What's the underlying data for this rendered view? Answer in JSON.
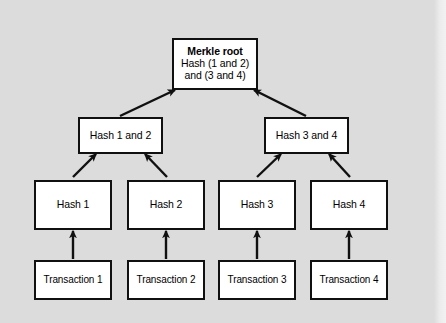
{
  "diagram": {
    "colors": {
      "background": "#dcdcdc",
      "node_fill": "#ffffff",
      "node_stroke": "#101010",
      "arrow": "#101010",
      "text": "#000000"
    },
    "nodes": {
      "root": {
        "heading": "Merkle root",
        "line1": "Hash (1 and 2)",
        "line2": "and (3 and 4)"
      },
      "branches": [
        {
          "label": "Hash 1 and 2"
        },
        {
          "label": "Hash 3 and 4"
        }
      ],
      "hashes": [
        {
          "label": "Hash 1"
        },
        {
          "label": "Hash 2"
        },
        {
          "label": "Hash 3"
        },
        {
          "label": "Hash 4"
        }
      ],
      "transactions": [
        {
          "label": "Transaction 1"
        },
        {
          "label": "Transaction 2"
        },
        {
          "label": "Transaction 3"
        },
        {
          "label": "Transaction 4"
        }
      ]
    },
    "edges": [
      {
        "from": "Hash 1 and 2",
        "to": "Merkle root"
      },
      {
        "from": "Hash 3 and 4",
        "to": "Merkle root"
      },
      {
        "from": "Hash 1",
        "to": "Hash 1 and 2"
      },
      {
        "from": "Hash 2",
        "to": "Hash 1 and 2"
      },
      {
        "from": "Hash 3",
        "to": "Hash 3 and 4"
      },
      {
        "from": "Hash 4",
        "to": "Hash 3 and 4"
      },
      {
        "from": "Transaction 1",
        "to": "Hash 1"
      },
      {
        "from": "Transaction 2",
        "to": "Hash 2"
      },
      {
        "from": "Transaction 3",
        "to": "Hash 3"
      },
      {
        "from": "Transaction 4",
        "to": "Hash 4"
      }
    ]
  }
}
